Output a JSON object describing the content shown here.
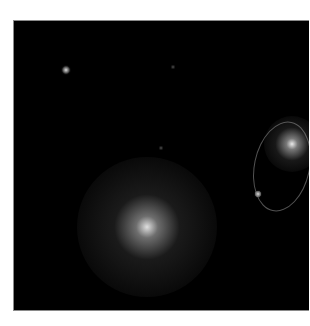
{
  "image": {
    "description": "Astronomical grayscale image showing a large diffuse glowing source, a second bright source enclosed by an elliptical region marker, and several point sources on a black background",
    "background_color": "#000000",
    "border_color": "#8a8a8a",
    "sources": [
      {
        "name": "diffuse-central-source",
        "x": 146,
        "y": 226,
        "radius": 70,
        "core": 8,
        "brightness": "bright-diffuse"
      },
      {
        "name": "enclosed-bright-source",
        "x": 291,
        "y": 143,
        "radius": 28,
        "core": 4,
        "brightness": "bright"
      },
      {
        "name": "point-source-upper-left",
        "x": 65,
        "y": 69,
        "radius": 5,
        "core": 2,
        "brightness": "medium"
      },
      {
        "name": "point-source-near-ellipse",
        "x": 257,
        "y": 193,
        "radius": 4,
        "core": 2,
        "brightness": "medium"
      },
      {
        "name": "faint-source-top",
        "x": 172,
        "y": 66,
        "radius": 3,
        "core": 1,
        "brightness": "faint"
      },
      {
        "name": "faint-source-middle",
        "x": 160,
        "y": 147,
        "radius": 3,
        "core": 1,
        "brightness": "faint"
      }
    ],
    "region_marker": {
      "shape": "ellipse",
      "color": "#969696",
      "left": 253,
      "top": 120,
      "width": 56,
      "height": 91,
      "rotation_deg": 12
    }
  }
}
